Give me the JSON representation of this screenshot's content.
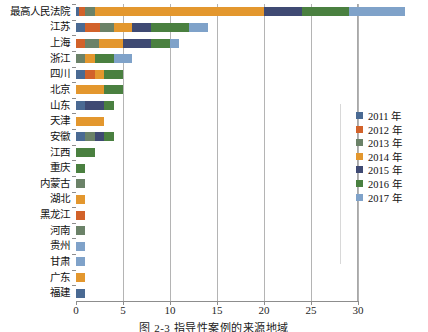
{
  "caption": "图 2-3   指导性案例的来源地域",
  "legend": {
    "position": "right",
    "entries": [
      {
        "label": "2011 年",
        "color": "#4a6a93"
      },
      {
        "label": "2012 年",
        "color": "#d2622a"
      },
      {
        "label": "2013 年",
        "color": "#6b8268"
      },
      {
        "label": "2014 年",
        "color": "#e3972e"
      },
      {
        "label": "2015 年",
        "color": "#3f4a73"
      },
      {
        "label": "2016 年",
        "color": "#4a8040"
      },
      {
        "label": "2017 年",
        "color": "#7fa2c9"
      }
    ]
  },
  "axis": {
    "xticks": [
      0,
      5,
      10,
      15,
      20,
      25,
      30
    ],
    "xticklabels": [
      "0",
      "5",
      "10",
      "15",
      "20",
      "25",
      "30"
    ],
    "xlim": [
      0,
      30
    ],
    "grid": "vertical"
  },
  "chart_data": {
    "type": "bar",
    "orientation": "horizontal",
    "stacked": true,
    "title": "",
    "xlabel": "",
    "ylabel": "",
    "xlim": [
      0,
      30
    ],
    "ylim": [
      0,
      20
    ],
    "grid": true,
    "legend_position": "right",
    "categories": [
      "最高人民法院",
      "江苏",
      "上海",
      "浙江",
      "四川",
      "北京",
      "山东",
      "天津",
      "安徽",
      "江西",
      "重庆",
      "内蒙古",
      "湖北",
      "黑龙江",
      "河南",
      "贵州",
      "甘肃",
      "广东",
      "福建"
    ],
    "series": [
      {
        "name": "2011 年",
        "color": "#4a6a93",
        "values": [
          0.3,
          1.0,
          0.0,
          0.0,
          1.0,
          0.0,
          1.0,
          0.0,
          1.0,
          0.0,
          0.0,
          0.0,
          0.0,
          0.0,
          0.0,
          0.0,
          0.0,
          0.0,
          1.0
        ]
      },
      {
        "name": "2012 年",
        "color": "#d2622a",
        "values": [
          0.7,
          1.6,
          1.0,
          0.0,
          1.0,
          0.0,
          0.0,
          0.0,
          0.0,
          0.0,
          0.0,
          0.0,
          0.0,
          1.0,
          0.0,
          0.0,
          0.0,
          0.0,
          0.0
        ]
      },
      {
        "name": "2013 年",
        "color": "#6b8268",
        "values": [
          1.0,
          1.4,
          1.5,
          1.0,
          0.0,
          0.0,
          0.0,
          0.0,
          1.0,
          0.0,
          0.0,
          1.0,
          0.0,
          0.0,
          1.0,
          0.0,
          0.0,
          0.0,
          0.0
        ]
      },
      {
        "name": "2014 年",
        "color": "#e3972e",
        "values": [
          18.0,
          2.0,
          2.5,
          1.0,
          1.0,
          3.0,
          0.0,
          3.0,
          0.0,
          0.0,
          0.0,
          0.0,
          1.0,
          0.0,
          0.0,
          0.0,
          0.0,
          1.0,
          0.0
        ]
      },
      {
        "name": "2015 年",
        "color": "#3f4a73",
        "values": [
          4.0,
          2.0,
          3.0,
          0.0,
          0.0,
          0.0,
          2.0,
          0.0,
          1.0,
          0.0,
          0.0,
          0.0,
          0.0,
          0.0,
          0.0,
          0.0,
          0.0,
          0.0,
          0.0
        ]
      },
      {
        "name": "2016 年",
        "color": "#4a8040",
        "values": [
          5.0,
          4.0,
          2.0,
          2.0,
          2.0,
          2.0,
          1.0,
          0.0,
          1.0,
          2.0,
          1.0,
          0.0,
          0.0,
          0.0,
          0.0,
          0.0,
          0.0,
          0.0,
          0.0
        ]
      },
      {
        "name": "2017 年",
        "color": "#7fa2c9",
        "values": [
          6.0,
          2.0,
          1.0,
          2.0,
          0.0,
          0.0,
          0.0,
          0.0,
          0.0,
          0.0,
          0.0,
          0.0,
          0.0,
          0.0,
          0.0,
          1.0,
          1.0,
          0.0,
          0.0
        ]
      }
    ],
    "totals": [
      35.0,
      14.0,
      11.0,
      6.0,
      5.0,
      5.0,
      4.0,
      3.0,
      4.0,
      2.0,
      1.0,
      1.0,
      1.0,
      1.0,
      1.0,
      1.0,
      1.0,
      1.0,
      1.0
    ]
  }
}
